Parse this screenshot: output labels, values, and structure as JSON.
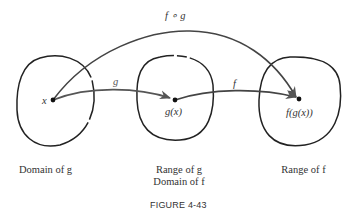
{
  "figure": {
    "caption": "FIGURE 4-43",
    "arrows": {
      "composite_label": "f ∘ g",
      "g_label": "g",
      "f_label": "f"
    },
    "points": {
      "x": "x",
      "gx": "g(x)",
      "fgx": "f(g(x))"
    },
    "sets": [
      {
        "line1": "Domain of g",
        "line2": ""
      },
      {
        "line1": "Range of g",
        "line2": "Domain of f"
      },
      {
        "line1": "Range of f",
        "line2": ""
      }
    ],
    "colors": {
      "stroke": "#222222",
      "arrow": "#555555",
      "text": "#333333"
    }
  }
}
